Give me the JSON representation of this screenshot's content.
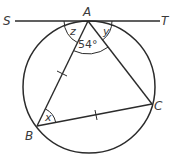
{
  "diagram": {
    "type": "circle-tangent-geometry",
    "points": {
      "S": {
        "label": "S"
      },
      "T": {
        "label": "T"
      },
      "A": {
        "label": "A"
      },
      "B": {
        "label": "B"
      },
      "C": {
        "label": "C"
      }
    },
    "angles": {
      "z": {
        "label": "z"
      },
      "y": {
        "label": "y"
      },
      "BAC": {
        "label": "54°"
      },
      "x": {
        "label": "x"
      }
    },
    "colors": {
      "line": "#2b2b2b",
      "text": "#3a3a3a",
      "background": "#ffffff"
    }
  }
}
